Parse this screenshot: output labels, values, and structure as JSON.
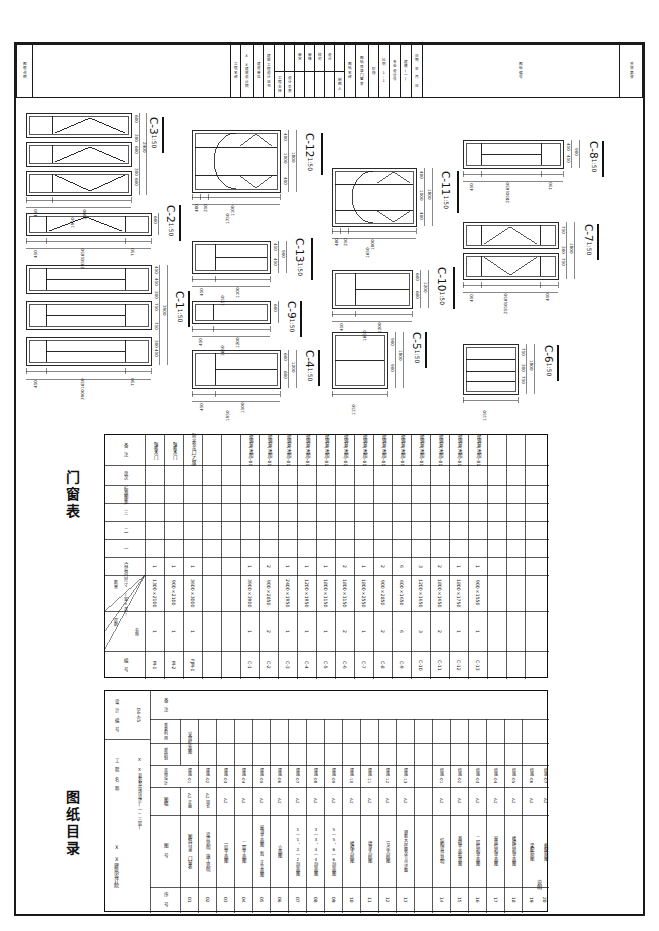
{
  "sheet": {
    "paper_size": "A2",
    "scale_note": "1:50",
    "border_color": "#1a1a1a"
  },
  "titleblock": {
    "label": "图框说明",
    "cells": [
      {
        "name": "project-name",
        "text": "工程名称"
      },
      {
        "name": "project-value",
        "text": "X X建筑设计院"
      },
      {
        "name": "design-unit",
        "text": "建设单位"
      },
      {
        "name": "design-cert",
        "text": "建筑工程设计证书"
      },
      {
        "name": "chief-engineer",
        "text": "工程主持"
      },
      {
        "name": "design-head",
        "text": "设计负责"
      },
      {
        "name": "review",
        "text": "审定"
      },
      {
        "name": "check",
        "text": "审核"
      },
      {
        "name": "proof",
        "text": "校对"
      },
      {
        "name": "design",
        "text": "设计"
      },
      {
        "name": "drawer",
        "text": "制图人"
      },
      {
        "name": "drawing-name",
        "text": "图纸名称"
      },
      {
        "name": "drawing-content",
        "text": "图纸目录门窗表"
      },
      {
        "name": "stage",
        "text": "阶段"
      },
      {
        "name": "ratio",
        "text": "比例 1:1"
      },
      {
        "name": "drawing-no-label",
        "text": "专业设计号"
      },
      {
        "name": "arch-no",
        "text": "建施(一)"
      },
      {
        "name": "date-label",
        "text": "日期 年 月 日"
      },
      {
        "name": "sheet-no",
        "text": "图纸编号"
      },
      {
        "name": "approval",
        "text": "共张第张"
      }
    ]
  },
  "windows": [
    {
      "id": "C-3",
      "scale": "1:50",
      "width_total": "1950",
      "widths": [
        "450",
        "1500"
      ],
      "heights": [
        "600",
        "300",
        "600",
        "300",
        "600"
      ],
      "height_total": "2400",
      "panes_rows": 3
    },
    {
      "id": "C-2",
      "scale": "1:50",
      "width_total": "2850",
      "widths": [
        "450",
        "1650",
        "750"
      ],
      "heights": [
        "600"
      ],
      "height_total": "600",
      "panes_rows": 1
    },
    {
      "id": "C-1",
      "scale": "1:50",
      "width_total": "3900",
      "widths": [
        "450",
        "1650",
        "750"
      ],
      "heights": [
        "450",
        "450",
        "300",
        "750",
        "750",
        "300",
        "450",
        "450"
      ],
      "height_total": "3900",
      "panes_rows": 3
    },
    {
      "id": "C-12",
      "scale": "1:50",
      "width_total": "1750",
      "widths": [
        "400",
        "250",
        "1100"
      ],
      "heights": [
        "400",
        "1000",
        "400"
      ],
      "height_total": "1800",
      "panes_rows": 3
    },
    {
      "id": "C-13",
      "scale": "1:50",
      "width_total": "1550",
      "widths": [
        "450",
        "1100"
      ],
      "heights": [
        "450",
        "450"
      ],
      "height_total": "900",
      "panes_rows": 2
    },
    {
      "id": "C-9",
      "scale": "1:50",
      "width_total": "1650",
      "widths": [
        "450",
        "1200"
      ],
      "heights": [
        "600"
      ],
      "height_total": "600",
      "panes_rows": 1
    },
    {
      "id": "C-4",
      "scale": "1:50",
      "width_total": "1950",
      "widths": [
        "450",
        "1500"
      ],
      "heights": [
        "600",
        "600"
      ],
      "height_total": "1200",
      "panes_rows": 2
    },
    {
      "id": "C-11",
      "scale": "1:50",
      "width_total": "1650",
      "widths": [
        "400",
        "250",
        "1000"
      ],
      "heights": [
        "400",
        "1000",
        "400"
      ],
      "height_total": "1800",
      "panes_rows": 3
    },
    {
      "id": "C-10",
      "scale": "1:50",
      "width_total": "1650",
      "widths": [
        "450",
        "1200"
      ],
      "heights": [
        "600",
        "600"
      ],
      "height_total": "1200",
      "panes_rows": 2
    },
    {
      "id": "C-5",
      "scale": "1:50",
      "width_total": "1150",
      "widths": [
        "1150"
      ],
      "heights": [
        "900",
        "900"
      ],
      "height_total": "1800",
      "panes_rows": 2
    },
    {
      "id": "C-8",
      "scale": "1:50",
      "width_total": "2850",
      "widths": [
        "450",
        "1650",
        "750"
      ],
      "heights": [
        "450",
        "450"
      ],
      "height_total": "900",
      "panes_rows": 2
    },
    {
      "id": "C-7",
      "scale": "1:50",
      "width_total": "2550",
      "widths": [
        "450",
        "1650",
        "450"
      ],
      "heights": [
        "750",
        "300",
        "750"
      ],
      "height_total": "1800",
      "panes_rows": 2
    },
    {
      "id": "C-6",
      "scale": "1:50",
      "width_total": "1150",
      "widths": [
        "1150"
      ],
      "heights": [
        "750",
        "300",
        "750"
      ],
      "height_total": "1800",
      "panes_rows": 2
    }
  ],
  "door_window_table": {
    "title": "门窗表",
    "headers": {
      "code": "编 号",
      "size": "洞口尺寸 (宽×高)",
      "count_corner_top": "数量",
      "count_corner_left": "层数",
      "count_corner_right": "名称",
      "total": "合计",
      "floor1": "一",
      "floor2": "二",
      "floor3": "三",
      "standard_atlas": "标准图集",
      "page": "页次",
      "remark": "备 注"
    },
    "rows": [
      {
        "code": "M-1",
        "size": "1300×2100",
        "total": "1",
        "f1": "1",
        "remark": "镶板木门"
      },
      {
        "code": "M-2",
        "size": "900×2100",
        "total": "1",
        "f1": "1",
        "remark": "镶板木门"
      },
      {
        "code": "FJM-1",
        "size": "3600×3000",
        "total": "1",
        "f1": "1",
        "remark": "防火卷帘门(乙级)"
      },
      {
        "code": "",
        "size": "",
        "total": "",
        "f1": "",
        "remark": ""
      },
      {
        "code": "",
        "size": "",
        "total": "",
        "f1": "",
        "remark": ""
      },
      {
        "code": "C-1",
        "size": "3900×3900",
        "total": "1",
        "f1": "1",
        "remark": "塑钢窗(透明)-01"
      },
      {
        "code": "C-2",
        "size": "900×2850",
        "total": "2",
        "f1": "2",
        "remark": "塑钢窗(透明)-01"
      },
      {
        "code": "C-3",
        "size": "2400×1950",
        "total": "1",
        "f1": "1",
        "remark": "塑钢窗(透明)-01"
      },
      {
        "code": "C-4",
        "size": "1200×1950",
        "total": "1",
        "f1": "1",
        "remark": "塑钢窗(透明)-01"
      },
      {
        "code": "C-5",
        "size": "1800×1150",
        "total": "1",
        "f1": "1",
        "remark": "塑钢窗(透明)-01"
      },
      {
        "code": "C-6",
        "size": "1800×1150",
        "total": "2",
        "f1": "2",
        "remark": "塑钢窗(透明)-01"
      },
      {
        "code": "C-7",
        "size": "1800×2550",
        "total": "1",
        "f1": "1",
        "remark": "塑钢窗(透明)-01"
      },
      {
        "code": "C-8",
        "size": "900×2850",
        "total": "2",
        "f1": "2",
        "remark": "塑钢窗(透明)-01"
      },
      {
        "code": "C-9",
        "size": "600×1650",
        "total": "6",
        "f1": "6",
        "remark": "塑钢窗(透明)-01"
      },
      {
        "code": "C-10",
        "size": "1200×1650",
        "total": "3",
        "f1": "3",
        "remark": "塑钢窗(透明)-01"
      },
      {
        "code": "C-11",
        "size": "1800×1650",
        "total": "2",
        "f1": "2",
        "remark": "塑钢窗(透明)-01"
      },
      {
        "code": "C-12",
        "size": "1800×1750",
        "total": "1",
        "f1": "1",
        "remark": "塑钢窗(透明)-01"
      },
      {
        "code": "C-13",
        "size": "900×1550",
        "total": "1",
        "f1": "1",
        "remark": "塑钢窗(透明)-01"
      }
    ]
  },
  "drawing_index": {
    "title": "图纸目录",
    "meta": {
      "design_no_label": "设 计 编 号",
      "design_no_value": "04-65",
      "project_label": "工 程 名 称",
      "project_value": "X X县农贸市场设计(一~三层)",
      "unit_label": "X X建筑设计院",
      "discipline": "( 建 筑 结 构 )图 纸 目 录"
    },
    "headers": {
      "seq": "序 号",
      "drawing_name": "图 纸 名 称",
      "drawing_no": "图 号",
      "size": "图幅",
      "std_atlas": "采用标准图",
      "atlas_name": "图集名称",
      "atlas_page": "其他设计",
      "new_draw": "新绘制",
      "repeat": "重复利用",
      "remark": "备 注"
    },
    "rows": [
      {
        "seq": "01",
        "name": "图纸目录 门窗表",
        "no": "建施-01",
        "size": "A2 正面"
      },
      {
        "seq": "02",
        "name": "设计说明 施工说明",
        "no": "建施-02",
        "size": "A2 加长"
      },
      {
        "seq": "03",
        "name": "一层平面图",
        "no": "建施-03",
        "size": "A2"
      },
      {
        "seq": "04",
        "name": "二层平面图",
        "no": "建施-04",
        "size": "A2"
      },
      {
        "seq": "05",
        "name": "屋顶平面图 新、正立面图",
        "no": "建施-05",
        "size": "A2"
      },
      {
        "seq": "06",
        "name": "立面图",
        "no": "建施-06",
        "size": "A2"
      },
      {
        "seq": "07",
        "name": "1—1、2—2剖面图",
        "no": "建施-07",
        "size": "A2"
      },
      {
        "seq": "08",
        "name": "3—3、4—4剖面图",
        "no": "建施-08",
        "size": "A2"
      },
      {
        "seq": "09",
        "name": "5—5、6—6剖面图",
        "no": "建施-09",
        "size": "A2"
      },
      {
        "seq": "10",
        "name": "楼梯大样图",
        "no": "建施-10",
        "size": "A2"
      },
      {
        "seq": "11",
        "name": "墙身大样图",
        "no": "建施-11",
        "size": "A2"
      },
      {
        "seq": "12",
        "name": "节点大样图",
        "no": "建施-12",
        "size": "A2"
      },
      {
        "seq": "13",
        "name": "钢筋大样图及节点详图",
        "no": "建施-13",
        "size": "A2"
      },
      {
        "seq": "14",
        "name": "结构设计说明",
        "no": "结施-01",
        "size": "A2"
      },
      {
        "seq": "15",
        "name": "基础平面布置图",
        "no": "结施-02",
        "size": "A2"
      },
      {
        "seq": "16",
        "name": "二层结构平面图",
        "no": "结施-03",
        "size": "A2"
      },
      {
        "seq": "17",
        "name": "屋面结构平面图",
        "no": "结施-04",
        "size": "A2"
      },
      {
        "seq": "18",
        "name": "楼梯结构平面图",
        "no": "结施-05",
        "size": "A2"
      },
      {
        "seq": "19",
        "name": "梁配筋图",
        "no": "结施-06",
        "size": "A2"
      },
      {
        "seq": "20",
        "name": "板配筋图",
        "no": "结施-07",
        "size": "A2"
      }
    ],
    "footer_label": "说明"
  }
}
